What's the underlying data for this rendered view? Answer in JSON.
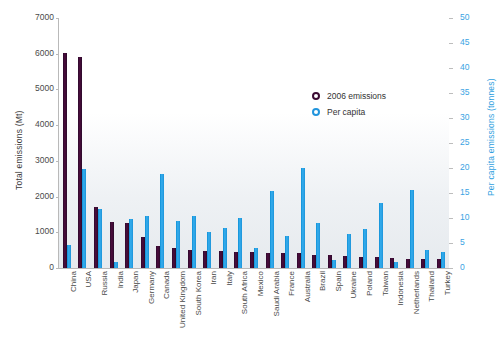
{
  "chart_data": {
    "type": "bar",
    "title": "",
    "subtitle": "",
    "xlabel": "",
    "ylabel": "Total emissions (Mt)",
    "y2label": "Per capita emissions (tonnes)",
    "ylim": [
      0,
      7000
    ],
    "y2lim": [
      0,
      50
    ],
    "yticks": [
      0,
      1000,
      2000,
      3000,
      4000,
      5000,
      6000,
      7000
    ],
    "y2ticks": [
      0,
      5,
      10,
      15,
      20,
      25,
      30,
      35,
      40,
      45,
      50
    ],
    "grid": false,
    "legend_position": "inside-top-right",
    "categories": [
      "China",
      "USA",
      "Russia",
      "India",
      "Japan",
      "Germany",
      "Canada",
      "United Kingdom",
      "South Korea",
      "Iran",
      "Italy",
      "South Africa",
      "Mexico",
      "Saudi Arabia",
      "France",
      "Australia",
      "Brazil",
      "Spain",
      "Ukraine",
      "Poland",
      "Taiwan",
      "Indonesia",
      "Netherlands",
      "Thailand",
      "Turkey"
    ],
    "series": [
      {
        "name": "2006 emissions",
        "axis": "left",
        "unit": "Mt",
        "color": "#3b0b33",
        "values": [
          6018,
          5903,
          1704,
          1293,
          1247,
          858,
          614,
          568,
          515,
          471,
          468,
          443,
          436,
          424,
          418,
          417,
          377,
          373,
          329,
          304,
          300,
          280,
          260,
          245,
          240
        ]
      },
      {
        "name": "Per capita",
        "axis": "right",
        "unit": "tonnes",
        "color": "#2295dd",
        "values": [
          4.6,
          19.8,
          11.8,
          1.2,
          9.8,
          10.4,
          18.8,
          9.4,
          10.5,
          7.3,
          8.0,
          10.0,
          4.1,
          15.4,
          6.4,
          20.1,
          9.1,
          1.6,
          6.9,
          7.9,
          13.0,
          1.2,
          15.7,
          3.7,
          3.3
        ]
      }
    ],
    "legend": [
      {
        "label": "2006 emissions",
        "marker": "circle-outline",
        "color": "#3b0b33"
      },
      {
        "label": "Per capita",
        "marker": "circle-outline",
        "color": "#2295dd"
      }
    ]
  }
}
